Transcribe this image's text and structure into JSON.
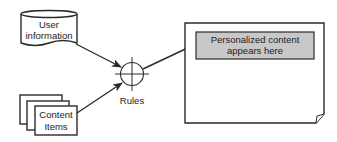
{
  "diagram": {
    "nodes": {
      "user_information": {
        "line1": "User",
        "line2": "information",
        "shape": "cylinder"
      },
      "content_items": {
        "line1": "Content",
        "line2": "Items",
        "shape": "stacked-documents"
      },
      "rules": {
        "label": "Rules",
        "shape": "crosshair-circle"
      },
      "output_page": {
        "line1": "Personalized content",
        "line2": "appears here",
        "shape": "page-with-curl",
        "highlight_fill": "#c8c8c8"
      }
    },
    "edges": [
      {
        "from": "user_information",
        "to": "rules"
      },
      {
        "from": "content_items",
        "to": "rules"
      },
      {
        "from": "rules",
        "to": "output_page"
      }
    ],
    "colors": {
      "stroke": "#2a2a2a",
      "background": "#ffffff",
      "highlight": "#c8c8c8"
    }
  }
}
